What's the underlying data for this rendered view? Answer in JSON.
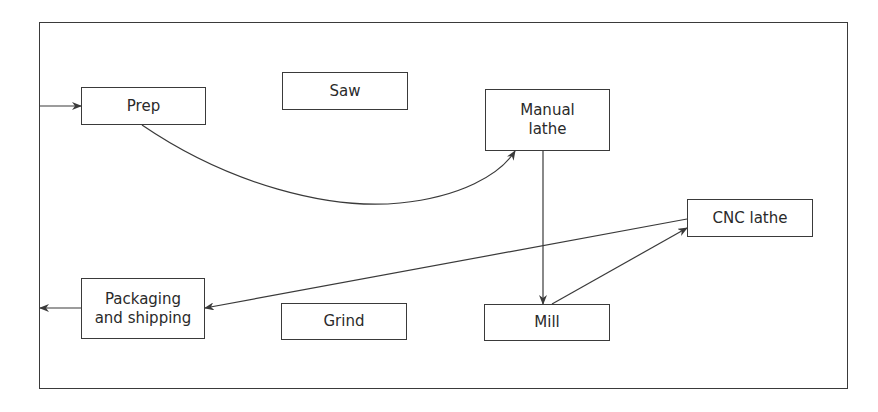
{
  "diagram": {
    "type": "process-flow layout",
    "colors": {
      "line": "#3a3a3a",
      "text": "#2a2a2a",
      "background": "#ffffff"
    },
    "nodes": [
      {
        "id": "prep",
        "label": "Prep",
        "x": 81,
        "y": 87,
        "w": 125,
        "h": 38
      },
      {
        "id": "saw",
        "label": "Saw",
        "x": 282,
        "y": 72,
        "w": 126,
        "h": 38
      },
      {
        "id": "manual_lathe",
        "label": "Manual\nlathe",
        "x": 485,
        "y": 89,
        "w": 125,
        "h": 62
      },
      {
        "id": "cnc_lathe",
        "label": "CNC lathe",
        "x": 687,
        "y": 199,
        "w": 126,
        "h": 38
      },
      {
        "id": "packaging",
        "label": "Packaging\nand shipping",
        "x": 81,
        "y": 278,
        "w": 124,
        "h": 61
      },
      {
        "id": "grind",
        "label": "Grind",
        "x": 281,
        "y": 303,
        "w": 126,
        "h": 37
      },
      {
        "id": "mill",
        "label": "Mill",
        "x": 484,
        "y": 304,
        "w": 126,
        "h": 37
      }
    ],
    "edges": [
      {
        "from": "entry",
        "to": "prep",
        "path": "M39,106 L81,106"
      },
      {
        "from": "prep",
        "to": "manual_lathe",
        "path": "M142,125 C230,185 330,210 400,203 C460,197 500,175 515,151"
      },
      {
        "from": "manual_lathe",
        "to": "mill",
        "path": "M543,151 L543,304"
      },
      {
        "from": "mill",
        "to": "cnc_lathe",
        "path": "M552,304 L687,228"
      },
      {
        "from": "cnc_lathe",
        "to": "packaging",
        "path": "M687,219 L205,308"
      },
      {
        "from": "packaging",
        "to": "exit",
        "path": "M81,308 L40,308"
      }
    ]
  }
}
